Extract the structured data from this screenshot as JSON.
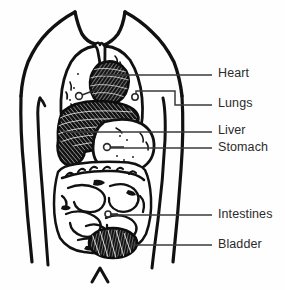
{
  "figure": {
    "type": "anatomical-diagram",
    "background_color": "#fefefe",
    "ink_color": "#111111",
    "label_color": "#2b2b2b"
  },
  "labels": [
    {
      "id": "heart",
      "text": "Heart",
      "text_x": 218,
      "text_y": 67,
      "leader": {
        "x1": 103,
        "y1": 75,
        "x2": 212,
        "y2": 75
      },
      "marker": {
        "cx": 79,
        "cy": 96,
        "r": 3.4
      }
    },
    {
      "id": "lungs",
      "text": "Lungs",
      "text_x": 218,
      "text_y": 97,
      "leader": {
        "x1": 140,
        "y1": 105,
        "x2": 212,
        "y2": 105
      },
      "marker": {
        "cx": 135,
        "cy": 97,
        "r": 3.2
      }
    },
    {
      "id": "liver",
      "text": "Liver",
      "text_x": 218,
      "text_y": 124,
      "leader": {
        "x1": 63,
        "y1": 132,
        "x2": 212,
        "y2": 132
      },
      "marker": null
    },
    {
      "id": "stomach",
      "text": "Stomach",
      "text_x": 218,
      "text_y": 141,
      "leader": {
        "x1": 110,
        "y1": 148,
        "x2": 212,
        "y2": 148
      },
      "marker": {
        "cx": 107,
        "cy": 147,
        "r": 3.4
      }
    },
    {
      "id": "intestines",
      "text": "Intestines",
      "text_x": 218,
      "text_y": 208,
      "leader": {
        "x1": 110,
        "y1": 215,
        "x2": 212,
        "y2": 215
      },
      "marker": {
        "cx": 108,
        "cy": 214,
        "r": 3.0
      }
    },
    {
      "id": "bladder",
      "text": "Bladder",
      "text_x": 218,
      "text_y": 238,
      "leader": {
        "x1": 130,
        "y1": 245,
        "x2": 212,
        "y2": 245
      },
      "marker": null
    }
  ],
  "organs": [
    {
      "id": "lungs",
      "name": "Lungs",
      "style": "outline"
    },
    {
      "id": "heart",
      "name": "Heart",
      "style": "dark-hatched"
    },
    {
      "id": "liver",
      "name": "Liver",
      "style": "dark-hatched"
    },
    {
      "id": "stomach",
      "name": "Stomach",
      "style": "outline-stippled"
    },
    {
      "id": "intestines",
      "name": "Intestines",
      "style": "coiled-outline"
    },
    {
      "id": "bladder",
      "name": "Bladder",
      "style": "dark-hatched"
    }
  ]
}
